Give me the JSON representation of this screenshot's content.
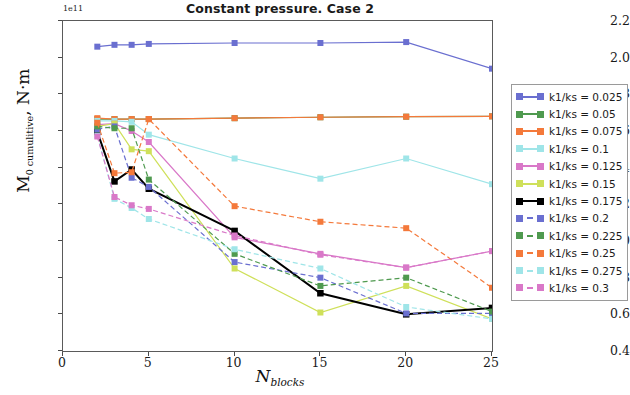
{
  "chart_data": {
    "type": "line",
    "title": "Constant pressure. Case 2",
    "xlabel": "N_blocks",
    "xlabel_main": "N",
    "xlabel_sub": "blocks",
    "ylabel": "M_0 cumulitive , N·m",
    "ylabel_main": "M",
    "ylabel_sub": "0 cumulitive",
    "ylabel_tail": ", N·m",
    "y_offset_text": "1e11",
    "xlim": [
      0,
      25
    ],
    "ylim": [
      0.4,
      2.2
    ],
    "xticks": [
      "0",
      "5",
      "10",
      "15",
      "20",
      "25"
    ],
    "xtick_values": [
      0,
      5,
      10,
      15,
      20,
      25
    ],
    "yticks": [
      "0.4",
      "0.6",
      "0.8",
      "1.0",
      "1.2",
      "1.4",
      "1.6",
      "1.8",
      "2.0",
      "2.2"
    ],
    "ytick_values": [
      0.4,
      0.6,
      0.8,
      1.0,
      1.2,
      1.4,
      1.6,
      1.8,
      2.0,
      2.2
    ],
    "grid": false,
    "legend_position": "right outside",
    "x": [
      2,
      3,
      4,
      5,
      10,
      15,
      20,
      25
    ],
    "series": [
      {
        "name": "k1/ks = 0.025",
        "label": "k1/ks = 0.025",
        "color": "#6a6fd0",
        "style": "solid",
        "values": [
          2.06,
          2.07,
          2.07,
          2.075,
          2.08,
          2.08,
          2.085,
          1.94
        ]
      },
      {
        "name": "k1/ks = 0.05",
        "label": "k1/ks = 0.05",
        "color": "#4f9a4f",
        "style": "solid",
        "values": [
          1.665,
          1.665,
          1.665,
          1.665,
          1.67,
          1.675,
          1.678,
          1.68
        ]
      },
      {
        "name": "k1/ks = 0.075",
        "label": "k1/ks = 0.075",
        "color": "#f4793b",
        "style": "solid",
        "values": [
          1.67,
          1.665,
          1.665,
          1.665,
          1.67,
          1.675,
          1.678,
          1.68
        ]
      },
      {
        "name": "k1/ks = 0.1",
        "label": "k1/ks = 0.1",
        "color": "#9fe5e8",
        "style": "solid",
        "values": [
          1.655,
          1.655,
          1.65,
          1.58,
          1.45,
          1.34,
          1.45,
          1.31
        ]
      },
      {
        "name": "k1/ks = 0.125",
        "label": "k1/ks = 0.125",
        "color": "#d978c8",
        "style": "solid",
        "values": [
          1.635,
          1.64,
          1.6,
          1.54,
          1.02,
          0.93,
          0.855,
          0.945
        ]
      },
      {
        "name": "k1/ks = 0.15",
        "label": "k1/ks = 0.15",
        "color": "#cfe05a",
        "style": "solid",
        "values": [
          1.625,
          1.64,
          1.5,
          1.49,
          0.85,
          0.61,
          0.755,
          0.575
        ]
      },
      {
        "name": "k1/ks = 0.175",
        "label": "k1/ks = 0.175",
        "color": "#000000",
        "style": "solid",
        "values": [
          1.595,
          1.325,
          1.39,
          1.285,
          1.055,
          0.715,
          0.6,
          0.635
        ]
      },
      {
        "name": "k1/ks = 0.2",
        "label": "k1/ks = 0.2",
        "color": "#6a6fd0",
        "style": "dashed",
        "values": [
          1.61,
          1.625,
          1.345,
          1.295,
          0.885,
          0.8,
          0.605,
          0.605
        ]
      },
      {
        "name": "k1/ks = 0.225",
        "label": "k1/ks = 0.225",
        "color": "#4f9a4f",
        "style": "dashed",
        "values": [
          1.625,
          1.615,
          1.615,
          1.335,
          0.93,
          0.755,
          0.8,
          0.615
        ]
      },
      {
        "name": "k1/ks = 0.25",
        "label": "k1/ks = 0.25",
        "color": "#f4793b",
        "style": "dashed",
        "values": [
          1.645,
          1.37,
          1.375,
          1.665,
          1.19,
          1.105,
          1.07,
          0.745
        ]
      },
      {
        "name": "k1/ks = 0.275",
        "label": "k1/ks = 0.275",
        "color": "#9fe5e8",
        "style": "dashed",
        "values": [
          1.575,
          1.23,
          1.18,
          1.12,
          0.955,
          0.85,
          0.64,
          0.575
        ]
      },
      {
        "name": "k1/ks = 0.3",
        "label": "k1/ks = 0.3",
        "color": "#d978c8",
        "style": "dashed",
        "values": [
          1.57,
          1.24,
          1.195,
          1.175,
          1.03,
          0.925,
          0.855,
          0.945
        ]
      }
    ]
  }
}
